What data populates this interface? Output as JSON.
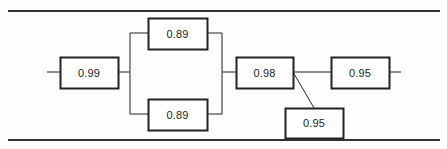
{
  "diagram": {
    "type": "reliability-block-diagram",
    "title": "",
    "background_color": "#fdfdfb",
    "line_color": "#222222",
    "box_fill_color": "#ffffff",
    "text_color": "#1b1b1b",
    "rule_color": "#333333",
    "blocks": [
      {
        "id": "block-1",
        "name": "block-0-99",
        "value": "0.99",
        "x": 60,
        "y": 57,
        "width": 58,
        "height": 31,
        "arrangement": "series"
      },
      {
        "id": "block-2",
        "name": "block-0-89-top",
        "value": "0.89",
        "x": 148,
        "y": 18,
        "width": 59,
        "height": 31,
        "arrangement": "parallel-top"
      },
      {
        "id": "block-3",
        "name": "block-0-89-bottom",
        "value": "0.89",
        "x": 148,
        "y": 99,
        "width": 59,
        "height": 31,
        "arrangement": "parallel-bottom"
      },
      {
        "id": "block-4",
        "name": "block-0-98",
        "value": "0.98",
        "x": 236,
        "y": 57,
        "width": 57,
        "height": 31,
        "arrangement": "series"
      },
      {
        "id": "block-5",
        "name": "block-0-95-lower",
        "value": "0.95",
        "x": 285,
        "y": 108,
        "width": 58,
        "height": 30,
        "arrangement": "annotated"
      },
      {
        "id": "block-6",
        "name": "block-0-95-right",
        "value": "0.95",
        "x": 331,
        "y": 57,
        "width": 58,
        "height": 31,
        "arrangement": "series"
      }
    ],
    "rules": [
      {
        "name": "top-rule",
        "x1": 8,
        "y1": 11,
        "x2": 440,
        "y2": 11
      },
      {
        "name": "bottom-rule",
        "x1": 8,
        "y1": 140,
        "x2": 440,
        "y2": 140
      }
    ],
    "connectors": [
      {
        "name": "input-stub",
        "points": "47,72 60,72"
      },
      {
        "name": "block1-to-split",
        "points": "118,72 130,72"
      },
      {
        "name": "split-bus",
        "points": "130,33 130,114"
      },
      {
        "name": "split-to-top-branch",
        "points": "130,33 148,33"
      },
      {
        "name": "split-to-bottom-branch",
        "points": "130,114 148,114"
      },
      {
        "name": "top-branch-to-merge",
        "points": "207,33 222,33"
      },
      {
        "name": "bottom-branch-to-merge",
        "points": "207,114 222,114"
      },
      {
        "name": "merge-bus",
        "points": "222,33 222,114"
      },
      {
        "name": "merge-to-block4",
        "points": "222,72 236,72"
      },
      {
        "name": "block4-to-block6",
        "points": "293,72 331,72"
      },
      {
        "name": "diagonal-to-lower-block",
        "points": "293,72 314,108"
      },
      {
        "name": "output-stub",
        "points": "389,72 401,72"
      }
    ]
  }
}
